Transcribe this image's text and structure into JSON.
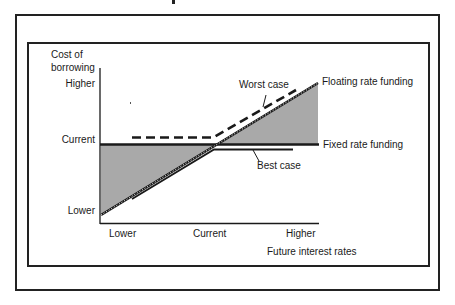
{
  "diagram": {
    "y_axis": {
      "title_line1": "Cost of",
      "title_line2": "borrowing",
      "ticks": {
        "higher": "Higher",
        "current": "Current",
        "lower": "Lower"
      }
    },
    "x_axis": {
      "title": "Future interest rates",
      "ticks": {
        "lower": "Lower",
        "current": "Current",
        "higher": "Higher"
      }
    },
    "series": {
      "floating": {
        "label": "Floating rate funding",
        "style": "dotted"
      },
      "fixed": {
        "label": "Fixed rate funding",
        "style": "solid"
      },
      "worst_case": {
        "label": "Worst case",
        "style": "dashed"
      },
      "best_case": {
        "label": "Best case",
        "style": "solid"
      }
    },
    "colors": {
      "line": "#1a1a1a",
      "shaded_area": "#a9a9a9",
      "background": "#ffffff"
    }
  }
}
